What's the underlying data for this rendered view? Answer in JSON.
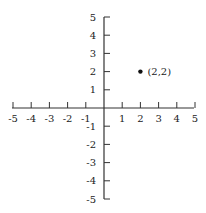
{
  "chart_data": {
    "type": "scatter",
    "title": "",
    "xlabel": "",
    "ylabel": "",
    "xlim": [
      -5,
      5
    ],
    "ylim": [
      -5,
      5
    ],
    "grid": false,
    "x_ticks": [
      "-5",
      "-4",
      "-3",
      "-2",
      "-1",
      "1",
      "2",
      "3",
      "4",
      "5"
    ],
    "y_ticks": [
      "5",
      "4",
      "3",
      "2",
      "1",
      "-1",
      "-2",
      "-3",
      "-4",
      "-5"
    ],
    "points": [
      {
        "x": 2,
        "y": 2,
        "label": "(2,2)"
      }
    ]
  },
  "colors": {
    "axis": "#333333",
    "point": "#111111",
    "text": "#222222"
  }
}
